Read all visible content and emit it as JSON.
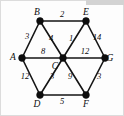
{
  "figure": {
    "kind": "weighted-undirected-graph-diagram",
    "background_color": "#fdfdfd",
    "border_color": "#dcdcdc",
    "ink_color": "#0d0d0d",
    "top_strip_color": "#d3d3d3"
  },
  "chart_data": {
    "type": "diagram",
    "title": "",
    "xlabel": "",
    "ylabel": "",
    "grid": false,
    "legend": "none",
    "nodes": [
      {
        "id": "A",
        "label": "A",
        "x": 22,
        "y": 58,
        "label_dx": -9,
        "label_dy": 2
      },
      {
        "id": "B",
        "label": "B",
        "x": 40,
        "y": 21,
        "label_dx": -3,
        "label_dy": -6
      },
      {
        "id": "C",
        "label": "C",
        "x": 63,
        "y": 58,
        "label_dx": -8,
        "label_dy": 11
      },
      {
        "id": "D",
        "label": "D",
        "x": 40,
        "y": 95,
        "label_dx": -3,
        "label_dy": 12
      },
      {
        "id": "E",
        "label": "E",
        "x": 86,
        "y": 21,
        "label_dx": 0,
        "label_dy": -6
      },
      {
        "id": "F",
        "label": "F",
        "x": 86,
        "y": 95,
        "label_dx": 0,
        "label_dy": 12
      },
      {
        "id": "G",
        "label": "G",
        "x": 105,
        "y": 58,
        "label_dx": 5,
        "label_dy": 3
      }
    ],
    "edges": [
      {
        "from": "A",
        "to": "B",
        "weight": "3",
        "wx": 27,
        "wy": 39
      },
      {
        "from": "B",
        "to": "E",
        "weight": "2",
        "wx": 62,
        "wy": 17
      },
      {
        "from": "A",
        "to": "C",
        "weight": "8",
        "wx": 43,
        "wy": 54
      },
      {
        "from": "B",
        "to": "C",
        "weight": "4",
        "wx": 51,
        "wy": 41
      },
      {
        "from": "C",
        "to": "E",
        "weight": "1",
        "wx": 71,
        "wy": 41
      },
      {
        "from": "E",
        "to": "G",
        "weight": "14",
        "wx": 97,
        "wy": 40
      },
      {
        "from": "C",
        "to": "G",
        "weight": "12",
        "wx": 85,
        "wy": 54
      },
      {
        "from": "A",
        "to": "D",
        "weight": "12",
        "wx": 25,
        "wy": 79
      },
      {
        "from": "C",
        "to": "D",
        "weight": "3",
        "wx": 52,
        "wy": 79
      },
      {
        "from": "C",
        "to": "F",
        "weight": "9",
        "wx": 70,
        "wy": 79
      },
      {
        "from": "F",
        "to": "G",
        "weight": "3",
        "wx": 99,
        "wy": 79
      },
      {
        "from": "D",
        "to": "F",
        "weight": "5",
        "wx": 62,
        "wy": 104
      }
    ],
    "node_labels": [
      "A",
      "B",
      "C",
      "D",
      "E",
      "F",
      "G"
    ],
    "weights": [
      "3",
      "2",
      "8",
      "4",
      "1",
      "14",
      "12",
      "12",
      "3",
      "9",
      "3",
      "5"
    ]
  }
}
